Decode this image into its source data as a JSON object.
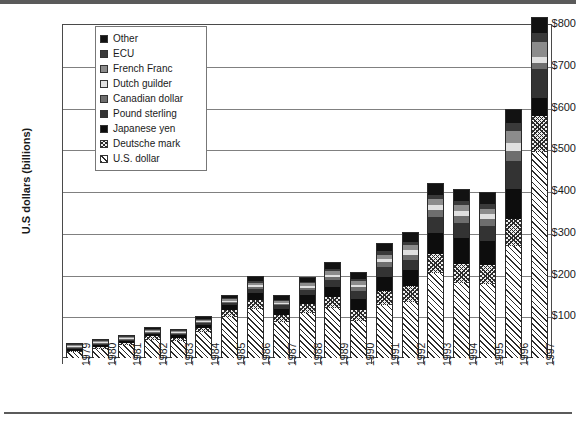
{
  "chart_data": {
    "type": "bar",
    "subtype": "stacked-bar",
    "title": "",
    "xlabel": "",
    "ylabel": "U.S dollars (billions)",
    "ylim": [
      0,
      800
    ],
    "ytick_labels": [
      "$800",
      "$700",
      "$600",
      "$500",
      "$400",
      "$300",
      "$200",
      "$100"
    ],
    "ytick_values": [
      800,
      700,
      600,
      500,
      400,
      300,
      200,
      100
    ],
    "grid": true,
    "legend_position": "upper-left-inside",
    "categories": [
      "1979",
      "1980",
      "1981",
      "1982",
      "1983",
      "1984",
      "1985",
      "1986",
      "1987",
      "1988",
      "1989",
      "1990",
      "1991",
      "1992",
      "1993",
      "1994",
      "1995",
      "1996",
      "1997"
    ],
    "series": [
      {
        "name": "U.S. dollar",
        "fill": "diagonal-hatch",
        "color": "#ffffff",
        "values": [
          14,
          22,
          30,
          44,
          40,
          62,
          98,
          118,
          86,
          108,
          120,
          88,
          126,
          134,
          204,
          180,
          178,
          268,
          494
        ]
      },
      {
        "name": "Deutsche mark",
        "fill": "cross-hatch",
        "color": "#efefef",
        "values": [
          4,
          5,
          6,
          8,
          8,
          10,
          16,
          20,
          16,
          22,
          26,
          28,
          34,
          38,
          44,
          46,
          44,
          66,
          86
        ]
      },
      {
        "name": "Japanese yen",
        "fill": "solid",
        "color": "#0d0d0d",
        "values": [
          3,
          4,
          5,
          6,
          6,
          8,
          12,
          18,
          16,
          20,
          24,
          26,
          34,
          38,
          52,
          62,
          58,
          72,
          42
        ]
      },
      {
        "name": "Pound sterling",
        "fill": "solid",
        "color": "#333333",
        "values": [
          1,
          2,
          2,
          3,
          3,
          4,
          6,
          10,
          8,
          12,
          16,
          18,
          24,
          26,
          38,
          36,
          36,
          66,
          70
        ]
      },
      {
        "name": "Canadian dollar",
        "fill": "solid",
        "color": "#6e6e6e",
        "values": [
          1,
          1,
          1,
          2,
          2,
          2,
          3,
          5,
          4,
          6,
          8,
          9,
          11,
          12,
          16,
          16,
          16,
          24,
          14
        ]
      },
      {
        "name": "Dutch guilder",
        "fill": "solid",
        "color": "#e0e0e0",
        "values": [
          1,
          1,
          1,
          1,
          1,
          2,
          2,
          4,
          3,
          5,
          6,
          7,
          9,
          10,
          12,
          12,
          12,
          18,
          16
        ]
      },
      {
        "name": "French Franc",
        "fill": "solid",
        "color": "#8c8c8c",
        "values": [
          1,
          1,
          1,
          2,
          2,
          2,
          3,
          5,
          4,
          6,
          8,
          8,
          10,
          12,
          14,
          14,
          14,
          30,
          34
        ]
      },
      {
        "name": "ECU",
        "fill": "solid",
        "color": "#3a3a3a",
        "values": [
          1,
          1,
          1,
          1,
          1,
          2,
          2,
          4,
          3,
          4,
          6,
          6,
          8,
          8,
          10,
          10,
          10,
          20,
          22
        ]
      },
      {
        "name": "Other",
        "fill": "solid",
        "color": "#121212",
        "values": [
          2,
          3,
          3,
          4,
          4,
          6,
          8,
          12,
          10,
          12,
          16,
          16,
          20,
          24,
          30,
          30,
          30,
          32,
          40
        ]
      }
    ],
    "totals": [
      28,
      40,
      50,
      71,
      67,
      98,
      150,
      196,
      150,
      195,
      230,
      206,
      276,
      302,
      420,
      406,
      398,
      596,
      818
    ],
    "annotations": []
  }
}
